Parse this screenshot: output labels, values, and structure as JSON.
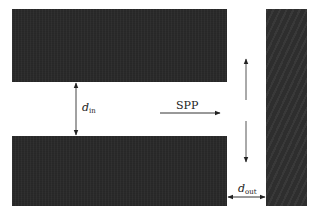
{
  "diagram": {
    "blocks": [
      {
        "id": "top-metal",
        "x": 12,
        "y": 9,
        "w": 215,
        "h": 73
      },
      {
        "id": "bottom-metal",
        "x": 12,
        "y": 136,
        "w": 215,
        "h": 70
      },
      {
        "id": "right-wall",
        "x": 266,
        "y": 9,
        "w": 41,
        "h": 197
      }
    ],
    "labels": {
      "d_in": {
        "base": "d",
        "sub": "in"
      },
      "d_out": {
        "base": "d",
        "sub": "out"
      },
      "spp": "SPP"
    },
    "arrows": [
      {
        "id": "d-in-arrow",
        "type": "double",
        "x1": 76,
        "y1": 82,
        "x2": 76,
        "y2": 136
      },
      {
        "id": "spp-arrow",
        "type": "single",
        "x1": 160,
        "y1": 113,
        "x2": 220,
        "y2": 113
      },
      {
        "id": "up-arrow",
        "type": "single",
        "x1": 246,
        "y1": 100,
        "x2": 246,
        "y2": 59
      },
      {
        "id": "down-arrow",
        "type": "single",
        "x1": 246,
        "y1": 121,
        "x2": 246,
        "y2": 162
      },
      {
        "id": "d-out-arrow",
        "type": "double",
        "x1": 227,
        "y1": 197,
        "x2": 266,
        "y2": 197
      }
    ],
    "colors": {
      "metal": "#2a2a2a",
      "arrow": "#333333",
      "background": "#ffffff"
    }
  }
}
